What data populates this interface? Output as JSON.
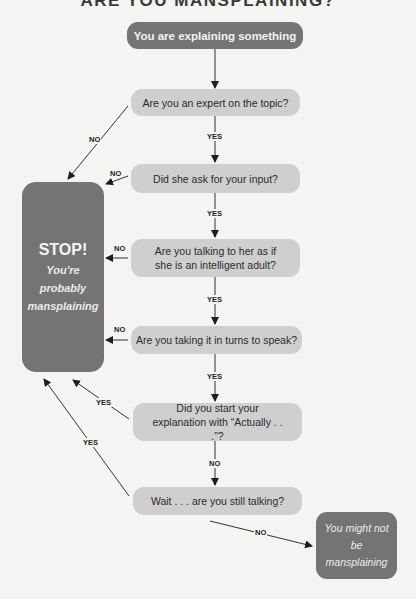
{
  "title": "ARE YOU MANSPLAINING?",
  "nodes": {
    "start": "You are explaining something",
    "q1": "Are you an expert on the topic?",
    "q2": "Did she ask for your input?",
    "q3": "Are you talking to her as if she is an intelligent adult?",
    "q4": "Are you taking it in turns to speak?",
    "q5": "Did you start your explanation with “Actually . . .”?",
    "q6": "Wait . . . are you still talking?",
    "stop": {
      "heading": "STOP!",
      "line1": "You're",
      "line2": "probably",
      "line3": "mansplaining"
    },
    "not": "You might not be mansplaining"
  },
  "edge_labels": {
    "q1_yes": "YES",
    "q1_no": "NO",
    "q2_yes": "YES",
    "q2_no": "NO",
    "q3_yes": "YES",
    "q3_no": "NO",
    "q4_yes": "YES",
    "q4_no": "NO",
    "q5_yes": "YES",
    "q5_no": "NO",
    "q6_yes": "YES",
    "q6_no": "NO"
  },
  "colors": {
    "dark_node": "#747474",
    "light_node": "#cfcfcf",
    "background": "#f4f4f2"
  }
}
